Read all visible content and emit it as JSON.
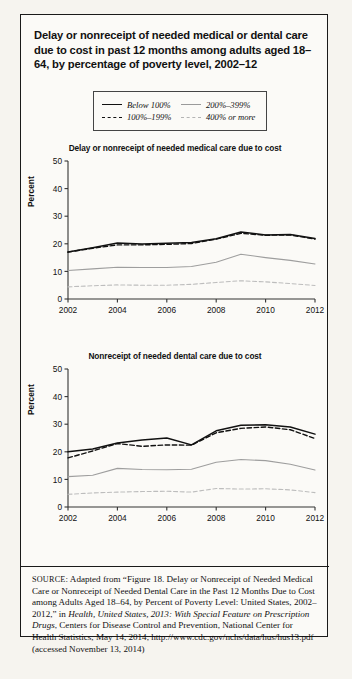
{
  "figure": {
    "title": "Delay or nonreceipt of needed medical or dental care due to cost in past 12 months among adults aged 18–64, by percentage of poverty level, 2002–12"
  },
  "legend": {
    "entries": [
      {
        "label": "Below 100%",
        "style": "solid-dark"
      },
      {
        "label": "200%–399%",
        "style": "solid-light"
      },
      {
        "label": "100%–199%",
        "style": "dash-dark"
      },
      {
        "label": "400% or more",
        "style": "dash-light"
      }
    ]
  },
  "source": {
    "prefix": "SOURCE",
    "text_1": ": Adapted from “Figure 18. Delay or Nonreceipt of Needed Medical Care or Nonreceipt of Needed Dental Care in the Past 12 Months Due to Cost among Adults Aged 18–64, by Percent of Poverty Level: United States, 2002–2012,” in ",
    "italic_1": "Health, United States, 2013: With Special Feature on Prescription Drugs",
    "text_2": ", Centers for Disease Control and Prevention, National Center for Health Statistics, May 14, 2014, http://www.cdc.gov/nchs/data/hus/hus13.pdf (accessed November 13, 2014)"
  },
  "chart_data": [
    {
      "type": "line",
      "title": "Delay or nonreceipt of needed medical care due to cost",
      "xlabel": "",
      "ylabel": "Percent",
      "x": [
        2002,
        2003,
        2004,
        2005,
        2006,
        2007,
        2008,
        2009,
        2010,
        2011,
        2012
      ],
      "xticks": [
        2002,
        2004,
        2006,
        2008,
        2010,
        2012
      ],
      "yticks": [
        0,
        10,
        20,
        30,
        40,
        50
      ],
      "ylim": [
        0,
        50
      ],
      "xlim": [
        2002,
        2012
      ],
      "grid": false,
      "legend_position": "above-plot",
      "series": [
        {
          "name": "Below 100%",
          "style": "solid-dark",
          "values": [
            17.0,
            18.6,
            20.3,
            19.9,
            20.2,
            20.5,
            21.8,
            24.3,
            23.2,
            23.4,
            21.9
          ]
        },
        {
          "name": "100%–199%",
          "style": "dash-dark",
          "values": [
            17.0,
            18.4,
            19.6,
            19.6,
            19.8,
            20.1,
            21.7,
            23.8,
            23.1,
            23.2,
            21.7
          ]
        },
        {
          "name": "200%–399%",
          "style": "solid-light",
          "values": [
            10.3,
            10.9,
            11.5,
            11.4,
            11.4,
            11.8,
            13.3,
            16.2,
            15.0,
            14.0,
            12.7
          ]
        },
        {
          "name": "400% or more",
          "style": "dash-light",
          "values": [
            4.4,
            4.8,
            5.1,
            5.0,
            5.0,
            5.3,
            6.0,
            6.6,
            6.2,
            5.6,
            4.9
          ]
        }
      ]
    },
    {
      "type": "line",
      "title": "Nonreceipt of needed dental care due to cost",
      "xlabel": "",
      "ylabel": "Percent",
      "x": [
        2002,
        2003,
        2004,
        2005,
        2006,
        2007,
        2008,
        2009,
        2010,
        2011,
        2012
      ],
      "xticks": [
        2002,
        2004,
        2006,
        2008,
        2010,
        2012
      ],
      "yticks": [
        0,
        10,
        20,
        30,
        40,
        50
      ],
      "ylim": [
        0,
        50
      ],
      "xlim": [
        2002,
        2012
      ],
      "grid": false,
      "legend_position": "above-plot",
      "series": [
        {
          "name": "Below 100%",
          "style": "solid-dark",
          "values": [
            20.0,
            21.0,
            23.2,
            24.3,
            25.0,
            22.5,
            27.6,
            29.6,
            29.8,
            29.0,
            26.4
          ]
        },
        {
          "name": "100%–199%",
          "style": "dash-dark",
          "values": [
            17.8,
            20.3,
            23.0,
            22.0,
            22.5,
            22.4,
            26.9,
            28.5,
            29.0,
            28.0,
            24.8
          ]
        },
        {
          "name": "200%–399%",
          "style": "solid-light",
          "values": [
            11.0,
            11.5,
            14.0,
            13.6,
            13.5,
            13.7,
            16.2,
            17.2,
            16.8,
            15.5,
            13.4
          ]
        },
        {
          "name": "400% or more",
          "style": "dash-light",
          "values": [
            4.6,
            5.1,
            5.4,
            5.6,
            5.7,
            5.4,
            6.7,
            6.5,
            6.6,
            6.2,
            5.2
          ]
        }
      ]
    }
  ]
}
